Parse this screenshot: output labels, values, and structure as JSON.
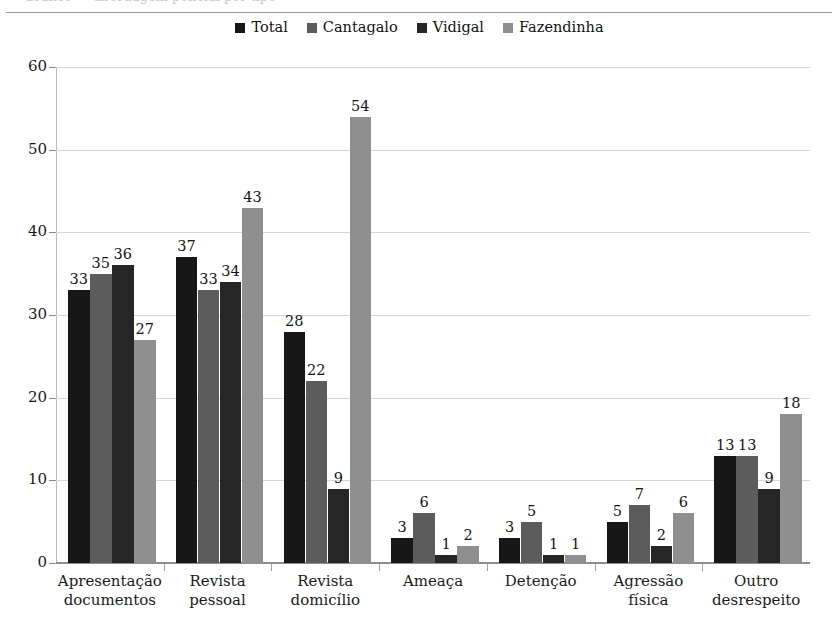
{
  "chart_data": {
    "type": "bar",
    "title": "",
    "xlabel": "",
    "ylabel": "",
    "ylim": [
      0,
      60
    ],
    "yticks": [
      0,
      10,
      20,
      30,
      40,
      50,
      60
    ],
    "grid": true,
    "legend_position": "top-center",
    "categories": [
      "Apresentação documentos",
      "Revista pessoal",
      "Revista domicílio",
      "Ameaça",
      "Detenção",
      "Agressão física",
      "Outro desrespeito"
    ],
    "category_lines": [
      [
        "Apresentação",
        "documentos"
      ],
      [
        "Revista",
        "pessoal"
      ],
      [
        "Revista",
        "domicílio"
      ],
      [
        "Ameaça",
        ""
      ],
      [
        "Detenção",
        ""
      ],
      [
        "Agressão",
        "física"
      ],
      [
        "Outro",
        "desrespeito"
      ]
    ],
    "series": [
      {
        "name": "Total",
        "color": "#171717",
        "values": [
          33,
          37,
          28,
          3,
          3,
          5,
          13
        ]
      },
      {
        "name": "Cantagalo",
        "color": "#5c5c5c",
        "values": [
          35,
          33,
          22,
          6,
          5,
          7,
          13
        ]
      },
      {
        "name": "Vidigal",
        "color": "#262626",
        "values": [
          36,
          34,
          9,
          1,
          1,
          2,
          9
        ]
      },
      {
        "name": "Fazendinha",
        "color": "#8f8f8f",
        "values": [
          27,
          43,
          54,
          2,
          1,
          6,
          18
        ]
      }
    ]
  },
  "legend": {
    "items": [
      {
        "label": "Total"
      },
      {
        "label": "Cantagalo"
      },
      {
        "label": "Vidigal"
      },
      {
        "label": "Fazendinha"
      }
    ]
  },
  "page": {
    "cropped_caption_remnant": "Gráfico — abordagem policial por tipo"
  }
}
